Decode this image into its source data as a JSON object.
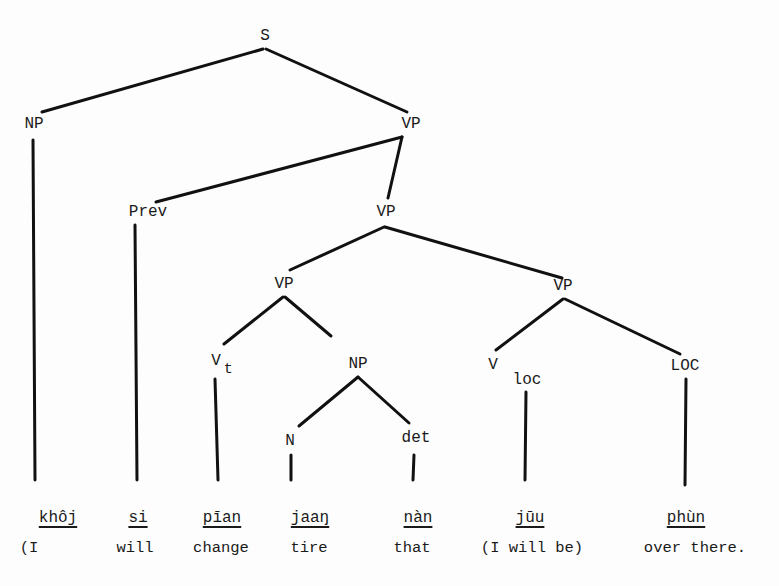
{
  "diagram": {
    "type": "syntax-tree",
    "nodes": {
      "s": "S",
      "np_subj": "NP",
      "vp_top": "VP",
      "prev": "Prev",
      "vp_mid": "VP",
      "vp_left": "VP",
      "vp_right": "VP",
      "vt": "V",
      "vt_sub": "t",
      "np_obj": "NP",
      "v_loc": "V",
      "v_loc_sub": "loc",
      "loc": "LOC",
      "n": "N",
      "det": "det"
    },
    "words": [
      "khôj",
      "si",
      "pīan",
      "jaaŋ",
      "nàn",
      "jūu",
      "phùn"
    ],
    "glosses": [
      "(I",
      "will",
      "change",
      "tire",
      "that",
      "(I will be)",
      "over there."
    ]
  }
}
